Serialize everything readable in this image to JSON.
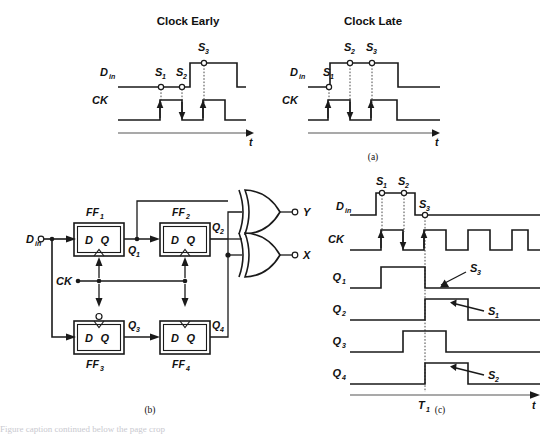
{
  "figure": {
    "panel_a": {
      "caption": "(a)",
      "left": {
        "title": "Clock Early",
        "signals": [
          {
            "name": "D",
            "subscript": "in"
          },
          {
            "name": "CK",
            "subscript": ""
          }
        ],
        "sample_labels": [
          "S",
          "S",
          "S"
        ],
        "sample_subs": [
          "1",
          "2",
          "3"
        ],
        "axis_label": "t",
        "din_waveform": "low at S1, low at S2, rises before third edge, high at S3, then falls",
        "ck_edges": [
          "rising",
          "falling",
          "rising"
        ]
      },
      "right": {
        "title": "Clock Late",
        "signals": [
          {
            "name": "D",
            "subscript": "in"
          },
          {
            "name": "CK",
            "subscript": ""
          }
        ],
        "sample_labels": [
          "S",
          "S",
          "S"
        ],
        "sample_subs": [
          "1",
          "2",
          "3"
        ],
        "axis_label": "t",
        "din_waveform": "low at S1, rises, high at S2 and S3, then falls",
        "ck_edges": [
          "rising",
          "falling",
          "rising"
        ]
      }
    },
    "panel_b": {
      "caption": "(b)",
      "input_label": {
        "name": "D",
        "subscript": "in"
      },
      "clock_label": "CK",
      "flipflops": [
        {
          "id": "FF",
          "sub": "1",
          "d": "D",
          "q": "Q",
          "out": "Q",
          "out_sub": "1",
          "clock_inverted": false
        },
        {
          "id": "FF",
          "sub": "2",
          "d": "D",
          "q": "Q",
          "out": "Q",
          "out_sub": "2",
          "clock_inverted": false
        },
        {
          "id": "FF",
          "sub": "3",
          "d": "D",
          "q": "Q",
          "out": "Q",
          "out_sub": "3",
          "clock_inverted": true
        },
        {
          "id": "FF",
          "sub": "4",
          "d": "D",
          "q": "Q",
          "out": "Q",
          "out_sub": "4",
          "clock_inverted": false
        }
      ],
      "gates": [
        {
          "type": "xor",
          "output": "Y",
          "inputs": [
            "Q1",
            "Q4"
          ]
        },
        {
          "type": "xor",
          "output": "X",
          "inputs": [
            "Q2",
            "Q4"
          ]
        }
      ]
    },
    "panel_c": {
      "caption": "(c)",
      "rows": [
        {
          "name": "D",
          "subscript": "in"
        },
        {
          "name": "CK",
          "subscript": ""
        },
        {
          "name": "Q",
          "subscript": "1"
        },
        {
          "name": "Q",
          "subscript": "2"
        },
        {
          "name": "Q",
          "subscript": "3"
        },
        {
          "name": "Q",
          "subscript": "4"
        }
      ],
      "sample_labels": [
        "S",
        "S",
        "S"
      ],
      "sample_subs": [
        "1",
        "2",
        "3"
      ],
      "annotations": [
        {
          "label": "S",
          "sub": "3",
          "points_to": "Q1"
        },
        {
          "label": "S",
          "sub": "1",
          "points_to": "Q2"
        },
        {
          "label": "S",
          "sub": "2",
          "points_to": "Q4"
        }
      ],
      "time_marker": {
        "name": "T",
        "subscript": "1"
      },
      "axis_label": "t",
      "ck_pulse_count": 4
    },
    "footer_text": "Figure caption continued below the page crop"
  }
}
